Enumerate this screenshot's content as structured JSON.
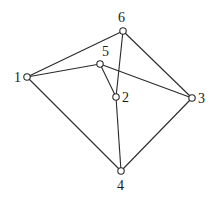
{
  "diagram": {
    "type": "graph",
    "nodes": [
      {
        "id": "1",
        "label": "1",
        "x": 27,
        "y": 77,
        "lx": 14,
        "ly": 82
      },
      {
        "id": "2",
        "label": "2",
        "x": 116,
        "y": 97,
        "lx": 122,
        "ly": 102
      },
      {
        "id": "3",
        "label": "3",
        "x": 192,
        "y": 98,
        "lx": 198,
        "ly": 103
      },
      {
        "id": "4",
        "label": "4",
        "x": 121,
        "y": 171,
        "lx": 117,
        "ly": 190
      },
      {
        "id": "5",
        "label": "5",
        "x": 100,
        "y": 64,
        "lx": 102,
        "ly": 56
      },
      {
        "id": "6",
        "label": "6",
        "x": 123,
        "y": 31,
        "lx": 118,
        "ly": 22
      }
    ],
    "edges": [
      [
        "1",
        "6"
      ],
      [
        "1",
        "5"
      ],
      [
        "1",
        "4"
      ],
      [
        "6",
        "3"
      ],
      [
        "6",
        "2"
      ],
      [
        "5",
        "2"
      ],
      [
        "5",
        "3"
      ],
      [
        "2",
        "4"
      ],
      [
        "3",
        "4"
      ]
    ]
  }
}
